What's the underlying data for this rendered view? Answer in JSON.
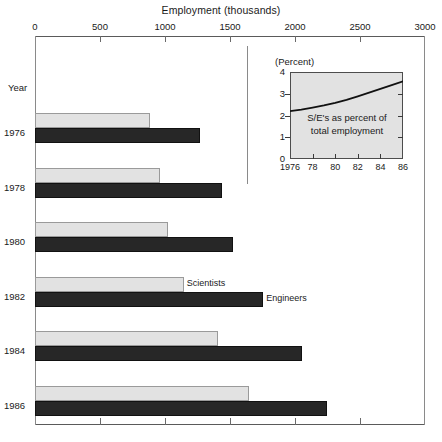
{
  "chart_data": {
    "type": "bar",
    "orientation": "horizontal",
    "title": "Employment (thousands)",
    "xlabel": "Employment (thousands)",
    "ylabel": "Year",
    "xlim": [
      0,
      3000
    ],
    "xticks": [
      0,
      500,
      1000,
      1500,
      2000,
      2500,
      3000
    ],
    "xtick_labels": [
      "0",
      "500",
      "1000",
      "1500",
      "2000",
      "2500",
      "3000"
    ],
    "categories": [
      "1976",
      "1978",
      "1980",
      "1982",
      "1984",
      "1986"
    ],
    "grid": false,
    "legend_position": "inline-annotation",
    "series": [
      {
        "name": "Scientists",
        "color": "#e2e2e2",
        "values": [
          885,
          960,
          1025,
          1145,
          1410,
          1645
        ]
      },
      {
        "name": "Engineers",
        "color": "#272727",
        "values": [
          1270,
          1440,
          1525,
          1755,
          2055,
          2245
        ]
      }
    ],
    "annotations": [
      {
        "text": "Scientists",
        "at_category": "1982",
        "series": "Scientists"
      },
      {
        "text": "Engineers",
        "at_category": "1982",
        "series": "Engineers"
      }
    ],
    "inset": {
      "type": "line",
      "title": "(Percent)",
      "caption_line1": "S/E's as percent of",
      "caption_line2": "total employment",
      "ylim": [
        0,
        4
      ],
      "yticks": [
        0,
        1,
        2,
        3,
        4
      ],
      "ytick_labels": [
        "0",
        "1",
        "2",
        "3",
        "4"
      ],
      "xticks": [
        1976,
        1978,
        1980,
        1982,
        1984,
        1986
      ],
      "xtick_labels": [
        "1976",
        "78",
        "80",
        "82",
        "84",
        "86"
      ],
      "x": [
        1976,
        1977,
        1978,
        1979,
        1980,
        1981,
        1982,
        1983,
        1984,
        1985,
        1986
      ],
      "values": [
        2.2,
        2.27,
        2.36,
        2.46,
        2.58,
        2.72,
        2.88,
        3.05,
        3.22,
        3.4,
        3.57
      ]
    }
  },
  "axis": {
    "top_label": "Employment (thousands)",
    "year_label": "Year",
    "ticks": [
      {
        "label": "0",
        "value": 0
      },
      {
        "label": "500",
        "value": 500
      },
      {
        "label": "1000",
        "value": 1000
      },
      {
        "label": "1500",
        "value": 1500
      },
      {
        "label": "2000",
        "value": 2000
      },
      {
        "label": "2500",
        "value": 2500
      },
      {
        "label": "3000",
        "value": 3000
      }
    ]
  },
  "rows": [
    {
      "year": "1976",
      "scientists": 885,
      "engineers": 1270
    },
    {
      "year": "1978",
      "scientists": 960,
      "engineers": 1440
    },
    {
      "year": "1980",
      "scientists": 1025,
      "engineers": 1525
    },
    {
      "year": "1982",
      "scientists": 1145,
      "engineers": 1755
    },
    {
      "year": "1984",
      "scientists": 1410,
      "engineers": 2055
    },
    {
      "year": "1986",
      "scientists": 1645,
      "engineers": 2245
    }
  ],
  "annotations": {
    "scientists": "Scientists",
    "engineers": "Engineers"
  },
  "inset": {
    "title": "(Percent)",
    "caption_line1": "S/E's as percent of",
    "caption_line2": "total employment",
    "ytick_labels": [
      "4",
      "3",
      "2",
      "1",
      "0"
    ],
    "xtick_labels": [
      "1976",
      "78",
      "80",
      "82",
      "84",
      "86"
    ]
  },
  "colors": {
    "scientists": "#e2e2e2",
    "engineers": "#272727",
    "inset_bg": "#e2e2e2",
    "axis": "#5a5a5a"
  }
}
